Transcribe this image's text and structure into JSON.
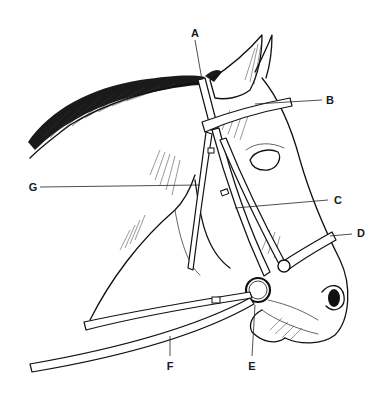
{
  "diagram": {
    "labels": [
      {
        "id": "A",
        "text": "A",
        "x": 195,
        "y": 33
      },
      {
        "id": "B",
        "text": "B",
        "x": 330,
        "y": 100
      },
      {
        "id": "C",
        "text": "C",
        "x": 338,
        "y": 200
      },
      {
        "id": "D",
        "text": "D",
        "x": 361,
        "y": 233
      },
      {
        "id": "E",
        "text": "E",
        "x": 252,
        "y": 366
      },
      {
        "id": "F",
        "text": "F",
        "x": 170,
        "y": 366
      },
      {
        "id": "G",
        "text": "G",
        "x": 33,
        "y": 187
      }
    ],
    "colors": {
      "ink": "#111111",
      "background": "#ffffff"
    }
  }
}
